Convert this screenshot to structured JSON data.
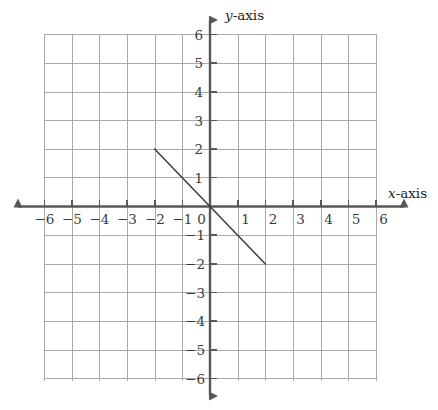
{
  "chart_data": {
    "type": "line",
    "title": "",
    "xlabel": "x-axis",
    "ylabel": "y-axis",
    "xlim": [
      -6,
      6
    ],
    "ylim": [
      -6,
      6
    ],
    "grid": true,
    "legend": "none",
    "x_ticks": [
      -6,
      -5,
      -4,
      -3,
      -2,
      -1,
      0,
      1,
      2,
      3,
      4,
      5,
      6
    ],
    "y_ticks": [
      -6,
      -5,
      -4,
      -3,
      -2,
      -1,
      0,
      1,
      2,
      3,
      4,
      5,
      6
    ],
    "x_tick_labels": [
      "−6",
      "−5",
      "−4",
      "−3",
      "−2",
      "−1",
      "0",
      "1",
      "2",
      "3",
      "4",
      "5",
      "6"
    ],
    "y_tick_labels": [
      "−6",
      "−5",
      "−4",
      "−3",
      "−2",
      "−1",
      "",
      "1",
      "2",
      "3",
      "4",
      "5",
      "6"
    ],
    "series": [
      {
        "name": "line-segment",
        "equation": "y = -x",
        "slope": -1,
        "intercept": 0,
        "x": [
          -2,
          2
        ],
        "values": [
          2,
          -2
        ],
        "points": [
          [
            -2,
            2
          ],
          [
            2,
            -2
          ]
        ],
        "color": "#3b3b3b"
      }
    ],
    "annotations": []
  },
  "axes": {
    "x_axis_label": "x-axis",
    "y_axis_label": "y-axis",
    "axis_label_suffix": "-axis",
    "x_axis_var": "x",
    "y_axis_var": "y",
    "origin_label": "0"
  },
  "colors": {
    "grid": "#a9a9ad",
    "axis": "#58585b",
    "line": "#3b3b3b",
    "text": "#3a3a3a",
    "background": "#ffffff"
  }
}
